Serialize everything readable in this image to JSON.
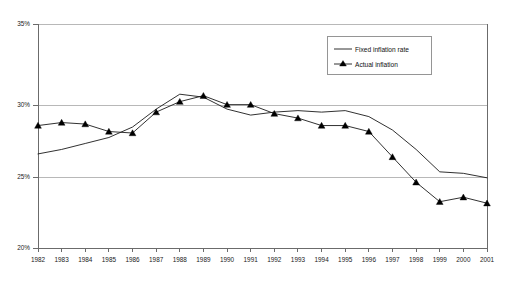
{
  "chart_data": {
    "type": "line",
    "title": "",
    "subtitle": "",
    "xlabel": "",
    "ylabel": "",
    "grid": true,
    "legend_position": "top-right",
    "x": [
      "1982",
      "1983",
      "1984",
      "1985",
      "1986",
      "1987",
      "1988",
      "1989",
      "1990",
      "1991",
      "1992",
      "1993",
      "1994",
      "1995",
      "1996",
      "1997",
      "1998",
      "1999",
      "2000",
      "2001"
    ],
    "categories": [
      "1982",
      "1983",
      "1984",
      "1985",
      "1986",
      "1987",
      "1988",
      "1989",
      "1990",
      "1991",
      "1992",
      "1993",
      "1994",
      "1995",
      "1996",
      "1997",
      "1998",
      "1999",
      "2000",
      "2001"
    ],
    "xlim": [
      1982,
      2001
    ],
    "ylim": [
      20,
      35
    ],
    "y_ticks": [
      20,
      25,
      30,
      35
    ],
    "y_tick_labels": [
      "20%",
      "25%",
      "30%",
      "35%"
    ],
    "series": [
      {
        "name": "Fixed inflation rate",
        "marker": "none",
        "color": "#1a1a1a",
        "values": [
          26.3,
          26.6,
          27.0,
          27.4,
          28.1,
          29.3,
          30.3,
          30.1,
          29.3,
          28.9,
          29.1,
          29.2,
          29.1,
          29.2,
          28.8,
          27.9,
          26.6,
          25.1,
          25.0,
          24.7
        ]
      },
      {
        "name": "Actual inflation",
        "marker": "triangle",
        "color": "#000000",
        "values": [
          28.2,
          28.4,
          28.3,
          27.8,
          27.7,
          29.1,
          29.8,
          30.2,
          29.6,
          29.6,
          29.0,
          28.7,
          28.2,
          28.2,
          27.8,
          26.1,
          24.4,
          23.1,
          23.4,
          23.0
        ]
      }
    ],
    "legend": [
      "Fixed inflation rate",
      "Actual inflation"
    ],
    "colors": {
      "axis": "#6b6b6b",
      "grid": "#b8b8b8",
      "series": "#1a1a1a",
      "marker": "#000000",
      "text": "#1a1a1a",
      "background": "#ffffff"
    }
  }
}
